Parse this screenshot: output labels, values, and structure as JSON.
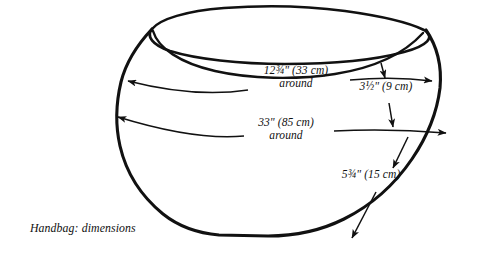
{
  "figure": {
    "caption": "Handbag: dimensions",
    "subject": "handbag",
    "view": "three-quarter front view of an open bowl-shaped handbag",
    "line_color": "#111111",
    "background_color": "#ffffff"
  },
  "annotations": {
    "upper_girth": {
      "name": "upper-girth",
      "value": "12¾\" (33 cm)",
      "qualifier": "around",
      "inches": "12¾",
      "centimeters": "33 cm",
      "arrow_style": "single-headed leader pointing left"
    },
    "depth": {
      "name": "top-band-depth",
      "value": "3½\" (9 cm)",
      "inches": "3½",
      "centimeters": "9 cm",
      "arrow_style": "vertical double-headed arrow"
    },
    "lower_girth": {
      "name": "lower-girth",
      "value": "33\" (85 cm)",
      "qualifier": "around",
      "inches": "33",
      "centimeters": "85 cm",
      "arrow_style": "single-headed leader pointing left"
    },
    "height": {
      "name": "body-height",
      "value": "5¾\" (15 cm)",
      "inches": "5¾",
      "centimeters": "15 cm",
      "arrow_style": "diagonal double-headed arrow"
    }
  },
  "icons": {
    "arrowhead": "arrowhead-icon"
  }
}
